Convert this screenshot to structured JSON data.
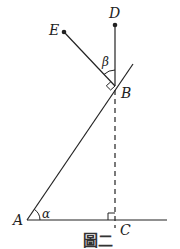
{
  "figure": {
    "caption": "圖二",
    "points": {
      "A": {
        "label": "A",
        "x": 27,
        "y": 220
      },
      "B": {
        "label": "B",
        "x": 115,
        "y": 86
      },
      "C": {
        "label": "C",
        "x": 115,
        "y": 220
      },
      "D": {
        "label": "D",
        "x": 115,
        "y": 25
      },
      "E": {
        "label": "E",
        "x": 64,
        "y": 32
      }
    },
    "angles": {
      "alpha": {
        "label": "α",
        "vertex": "A"
      },
      "beta": {
        "label": "β",
        "vertex": "B"
      }
    },
    "right_angles": [
      "B",
      "C"
    ],
    "segments": [
      {
        "from": "A",
        "to": "B",
        "extended": true,
        "style": "solid"
      },
      {
        "from": "A",
        "to": "C",
        "extended": true,
        "style": "solid"
      },
      {
        "from": "B",
        "to": "D",
        "style": "solid"
      },
      {
        "from": "B",
        "to": "E",
        "style": "solid"
      },
      {
        "from": "B",
        "to": "C",
        "style": "dashed"
      }
    ],
    "colors": {
      "line": "#222222",
      "background": "#ffffff"
    }
  }
}
